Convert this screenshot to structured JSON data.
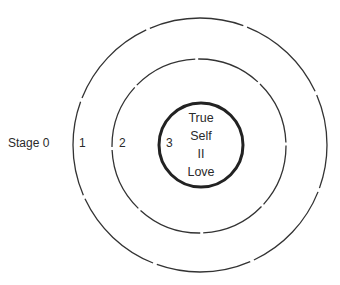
{
  "diagram": {
    "type": "concentric-circles",
    "labels": {
      "stage0": "Stage 0",
      "stage1": "1",
      "stage2": "2",
      "stage3": "3"
    },
    "center": {
      "line1": "True",
      "line2": "Self",
      "line3": "II",
      "line4": "Love"
    },
    "colors": {
      "stroke": "#2a2a2a",
      "background": "#ffffff"
    }
  }
}
